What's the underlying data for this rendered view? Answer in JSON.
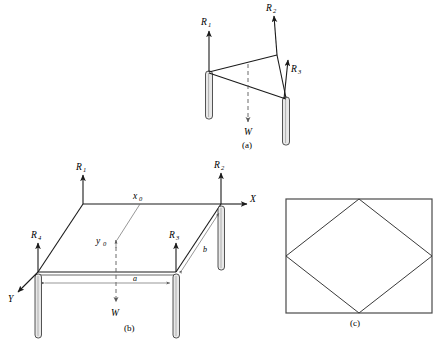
{
  "figure": {
    "background_color": "#ffffff",
    "line_color": "#1a1a1a",
    "panels": [
      {
        "key": "a",
        "caption": "(a)",
        "description": "three-leg perspective free-body diagram"
      },
      {
        "key": "b",
        "caption": "(b)",
        "description": "four-leg perspective free-body diagram with axes"
      },
      {
        "key": "c",
        "caption": "(c)",
        "description": "plan view rectangle with inscribed rhombus"
      }
    ]
  },
  "panel_a": {
    "caption": "(a)",
    "forces": [
      {
        "name": "R1",
        "label": "R",
        "sub": "1"
      },
      {
        "name": "R2",
        "label": "R",
        "sub": "2"
      },
      {
        "name": "R3",
        "label": "R",
        "sub": "3"
      }
    ],
    "weight": {
      "label": "W"
    }
  },
  "panel_b": {
    "caption": "(b)",
    "forces": [
      {
        "name": "R1",
        "label": "R",
        "sub": "1"
      },
      {
        "name": "R2",
        "label": "R",
        "sub": "2"
      },
      {
        "name": "R3",
        "label": "R",
        "sub": "3"
      },
      {
        "name": "R4",
        "label": "R",
        "sub": "4"
      }
    ],
    "weight": {
      "label": "W"
    },
    "axes": [
      {
        "name": "X",
        "label": "X"
      },
      {
        "name": "Y",
        "label": "Y"
      }
    ],
    "coordinates": [
      {
        "name": "x0",
        "label": "x",
        "sub": "0"
      },
      {
        "name": "y0",
        "label": "y",
        "sub": "0"
      }
    ],
    "dimensions": [
      {
        "name": "a",
        "label": "a"
      },
      {
        "name": "b",
        "label": "b"
      }
    ]
  },
  "panel_c": {
    "caption": "(c)",
    "shapes": [
      {
        "name": "outer-rectangle",
        "type": "rectangle"
      },
      {
        "name": "inscribed-rhombus",
        "type": "rhombus"
      }
    ]
  }
}
